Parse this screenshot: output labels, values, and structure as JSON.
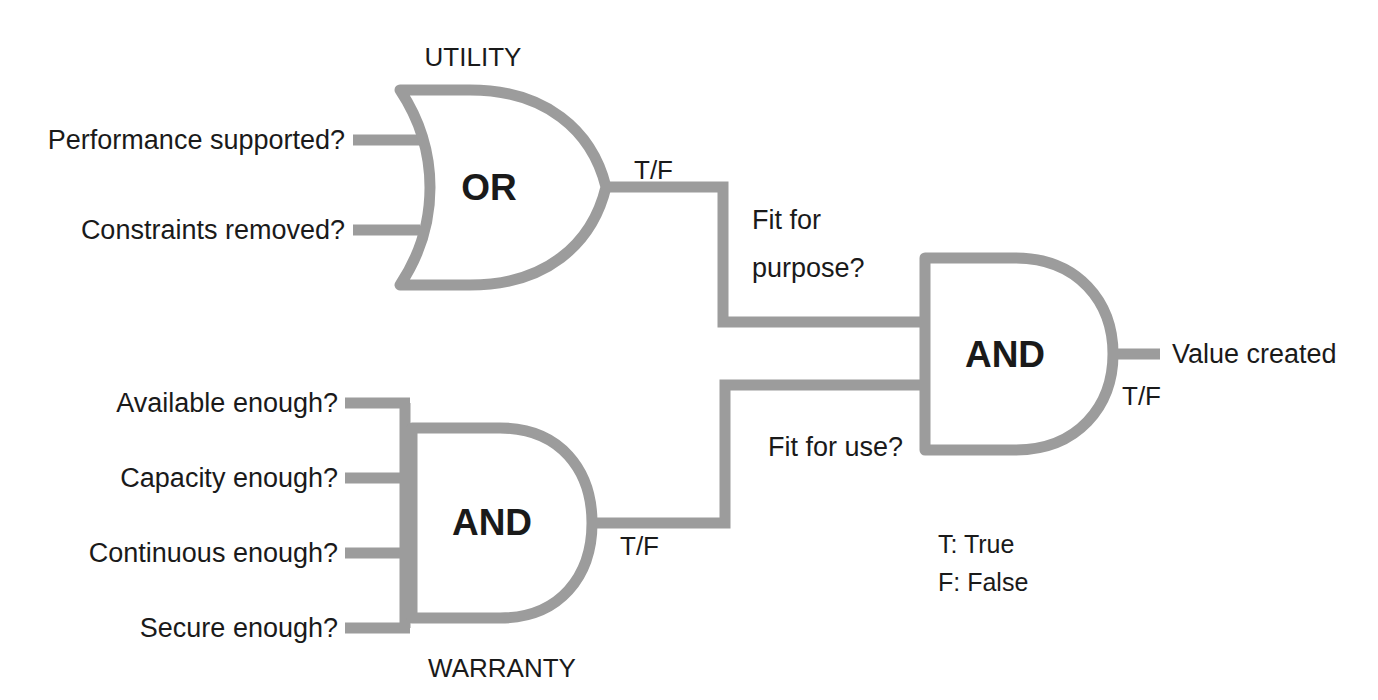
{
  "diagram": {
    "colors": {
      "wire": "#9c9c9c",
      "text": "#1a1a1a",
      "background": "#ffffff"
    },
    "utility_gate": {
      "group_label": "UTILITY",
      "gate_type": "OR",
      "gate_label": "OR",
      "inputs": [
        {
          "label": "Performance supported?"
        },
        {
          "label": "Constraints removed?"
        }
      ],
      "output_tf": "T/F",
      "output_label": "Fit for\npurpose?",
      "output_label_line1": "Fit for",
      "output_label_line2": "purpose?"
    },
    "warranty_gate": {
      "group_label": "WARRANTY",
      "gate_type": "AND",
      "gate_label": "AND",
      "inputs": [
        {
          "label": "Available enough?"
        },
        {
          "label": "Capacity enough?"
        },
        {
          "label": "Continuous enough?"
        },
        {
          "label": "Secure enough?"
        }
      ],
      "output_tf": "T/F",
      "output_label": "Fit for use?"
    },
    "final_gate": {
      "gate_type": "AND",
      "gate_label": "AND",
      "output_tf": "T/F",
      "output_label": "Value created"
    },
    "legend": [
      {
        "text": "T: True"
      },
      {
        "text": "F: False"
      }
    ]
  }
}
